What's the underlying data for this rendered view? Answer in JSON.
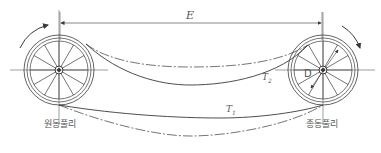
{
  "diagram": {
    "labels": {
      "center_distance": "E",
      "tension_slack": "T",
      "tension_slack_sub": "2",
      "tension_tight": "T",
      "tension_tight_sub": "1",
      "diameter": "D",
      "driving_pulley": "원동풀리",
      "driven_pulley": "종동풀리"
    },
    "colors": {
      "line": "#3a3a3a",
      "text": "#555555",
      "background": "#ffffff"
    }
  }
}
